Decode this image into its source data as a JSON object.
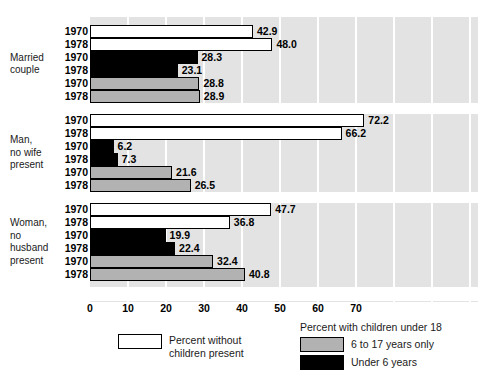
{
  "chart_data": {
    "type": "bar",
    "orientation": "horizontal",
    "title": "",
    "subtitle": "",
    "xlabel": "",
    "ylabel": "",
    "xlim": [
      0,
      102
    ],
    "xticks": [
      0,
      10,
      20,
      30,
      40,
      50,
      60,
      70
    ],
    "xticklabels": [
      "0",
      "10",
      "20",
      "30",
      "40",
      "50",
      "60",
      "70"
    ],
    "grid": true,
    "grid_axis": "x",
    "legend_position": "bottom",
    "plot_background": "#e3e3e3",
    "gridline_color": "#ffffff",
    "series": [
      {
        "name": "Percent without children present",
        "key": "white",
        "color": "#ffffff",
        "values": [
          42.9,
          48.0,
          72.2,
          66.2,
          47.7,
          36.8
        ]
      },
      {
        "name": "Under 6 years",
        "key": "black",
        "color": "#000000",
        "values": [
          28.3,
          23.1,
          6.2,
          7.3,
          19.9,
          22.4
        ]
      },
      {
        "name": "6 to 17 years only",
        "key": "gray",
        "color": "#b2b2b2",
        "values": [
          28.8,
          28.9,
          21.6,
          26.5,
          32.4,
          40.8
        ]
      }
    ],
    "groups": [
      {
        "label": "Married\ncouple",
        "bars": [
          {
            "year": "1970",
            "series": "white",
            "value": 42.9,
            "label": "42.9"
          },
          {
            "year": "1978",
            "series": "white",
            "value": 48.0,
            "label": "48.0"
          },
          {
            "year": "1970",
            "series": "black",
            "value": 28.3,
            "label": "28.3"
          },
          {
            "year": "1978",
            "series": "black",
            "value": 23.1,
            "label": "23.1"
          },
          {
            "year": "1970",
            "series": "gray",
            "value": 28.8,
            "label": "28.8"
          },
          {
            "year": "1978",
            "series": "gray",
            "value": 28.9,
            "label": "28.9"
          }
        ]
      },
      {
        "label": "Man,\nno wife\npresent",
        "bars": [
          {
            "year": "1970",
            "series": "white",
            "value": 72.2,
            "label": "72.2"
          },
          {
            "year": "1978",
            "series": "white",
            "value": 66.2,
            "label": "66.2"
          },
          {
            "year": "1970",
            "series": "black",
            "value": 6.2,
            "label": "6.2"
          },
          {
            "year": "1978",
            "series": "black",
            "value": 7.3,
            "label": "7.3"
          },
          {
            "year": "1970",
            "series": "gray",
            "value": 21.6,
            "label": "21.6"
          },
          {
            "year": "1978",
            "series": "gray",
            "value": 26.5,
            "label": "26.5"
          }
        ]
      },
      {
        "label": "Woman,\nno\nhusband\npresent",
        "bars": [
          {
            "year": "1970",
            "series": "white",
            "value": 47.7,
            "label": "47.7"
          },
          {
            "year": "1978",
            "series": "white",
            "value": 36.8,
            "label": "36.8"
          },
          {
            "year": "1970",
            "series": "black",
            "value": 19.9,
            "label": "19.9"
          },
          {
            "year": "1978",
            "series": "black",
            "value": 22.4,
            "label": "22.4"
          },
          {
            "year": "1970",
            "series": "gray",
            "value": 32.4,
            "label": "32.4"
          },
          {
            "year": "1978",
            "series": "gray",
            "value": 40.8,
            "label": "40.8"
          }
        ]
      }
    ]
  },
  "legend": {
    "left": {
      "swatch": "white",
      "text": "Percent without\nchildren present"
    },
    "right": {
      "title": "Percent with children under 18",
      "items": [
        {
          "swatch": "gray",
          "text": "6 to 17 years only"
        },
        {
          "swatch": "black",
          "text": "Under 6 years"
        }
      ]
    }
  }
}
